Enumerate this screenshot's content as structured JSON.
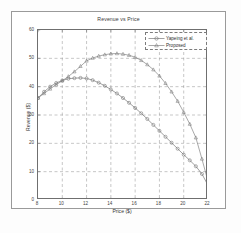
{
  "chart_data": {
    "type": "line",
    "title": "Revenue vs Price",
    "xlabel": "Price ($)",
    "ylabel": "Revenue ($)",
    "xlim": [
      8,
      22
    ],
    "ylim": [
      0,
      60
    ],
    "xticks": [
      8,
      10,
      12,
      14,
      16,
      18,
      20,
      22
    ],
    "yticks": [
      0,
      10,
      20,
      30,
      40,
      50,
      60
    ],
    "grid": true,
    "legend_position": "upper right",
    "x": [
      8,
      8.5,
      9,
      9.5,
      10,
      10.5,
      11,
      11.5,
      12,
      12.5,
      13,
      13.5,
      14,
      14.5,
      15,
      15.5,
      16,
      16.5,
      17,
      17.5,
      18,
      18.5,
      19,
      19.5,
      20,
      20.5,
      21,
      21.5,
      22
    ],
    "series": [
      {
        "name": "Yapeing et al.",
        "marker": "circle",
        "color": "#6d6d6d",
        "values": [
          36.0,
          38.2,
          40.0,
          41.3,
          42.2,
          42.8,
          43.0,
          43.1,
          42.9,
          42.3,
          41.4,
          40.3,
          39.0,
          37.6,
          36.0,
          34.3,
          32.5,
          30.6,
          28.6,
          26.5,
          24.4,
          22.3,
          20.2,
          18.1,
          16.0,
          14.0,
          11.9,
          9.2,
          5.2
        ]
      },
      {
        "name": "Proposed",
        "marker": "triangle",
        "color": "#7a7a7a",
        "values": [
          36.0,
          37.6,
          39.2,
          40.7,
          42.1,
          43.6,
          45.3,
          47.2,
          49.1,
          50.1,
          50.8,
          51.3,
          51.6,
          51.7,
          51.5,
          51.1,
          50.4,
          49.3,
          47.8,
          46.0,
          43.8,
          41.2,
          38.2,
          34.9,
          31.0,
          26.8,
          22.0,
          14.5,
          6.6
        ]
      }
    ]
  },
  "legend": {
    "entries": [
      {
        "label": "Yapeing et al."
      },
      {
        "label": "Proposed"
      }
    ]
  },
  "axis": {
    "x_tick_labels": [
      "8",
      "10",
      "12",
      "14",
      "16",
      "18",
      "20",
      "22"
    ],
    "y_tick_labels": [
      "0",
      "10",
      "20",
      "30",
      "40",
      "50",
      "60"
    ]
  }
}
